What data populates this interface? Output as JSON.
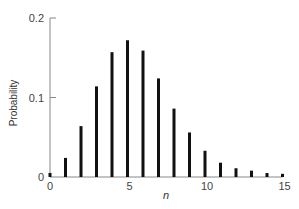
{
  "chart_data": {
    "type": "bar",
    "title": "",
    "xlabel": "n",
    "ylabel": "Probability",
    "x": [
      0,
      1,
      2,
      3,
      4,
      5,
      6,
      7,
      8,
      9,
      10,
      11,
      12,
      13,
      14,
      15
    ],
    "values": [
      0.005,
      0.024,
      0.064,
      0.114,
      0.157,
      0.172,
      0.159,
      0.124,
      0.086,
      0.056,
      0.033,
      0.018,
      0.011,
      0.008,
      0.005,
      0.004
    ],
    "xlim": [
      0,
      15
    ],
    "ylim": [
      0,
      0.2
    ],
    "xticks": [
      0,
      5,
      10,
      15
    ],
    "xtick_labels": [
      "0",
      "5",
      "10",
      "15"
    ],
    "yticks": [
      0,
      0.1,
      0.2
    ],
    "ytick_labels": [
      "0",
      "0.1",
      "0.2"
    ],
    "grid": false,
    "legend": null,
    "style": {
      "bar_color": "#111111",
      "axis_color": "#888888"
    }
  }
}
